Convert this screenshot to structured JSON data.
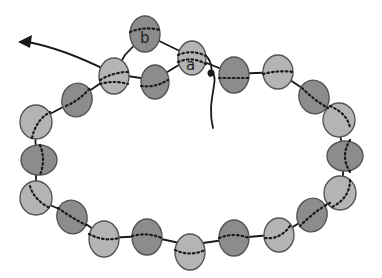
{
  "diagram": {
    "labels": {
      "a": "a",
      "b": "b"
    },
    "colors": {
      "light_bead": "#b4b4b4",
      "dark_bead": "#8c8c8c",
      "thread": "#1a1a1a"
    },
    "beads": [
      {
        "id": "b",
        "shade": "dark",
        "label": "b"
      },
      {
        "id": "a",
        "shade": "light",
        "label": "a"
      },
      {
        "id": "top-right-1",
        "shade": "dark"
      },
      {
        "id": "top-right-2",
        "shade": "light"
      },
      {
        "id": "right-1",
        "shade": "dark"
      },
      {
        "id": "right-2",
        "shade": "light"
      },
      {
        "id": "right-3",
        "shade": "dark"
      },
      {
        "id": "right-4",
        "shade": "light"
      },
      {
        "id": "bottom-right-1",
        "shade": "dark"
      },
      {
        "id": "bottom-right-2",
        "shade": "light"
      },
      {
        "id": "bottom-1",
        "shade": "dark"
      },
      {
        "id": "bottom-2",
        "shade": "light"
      },
      {
        "id": "bottom-3",
        "shade": "dark"
      },
      {
        "id": "bottom-4",
        "shade": "light"
      },
      {
        "id": "left-1",
        "shade": "dark"
      },
      {
        "id": "left-2",
        "shade": "light"
      },
      {
        "id": "left-3",
        "shade": "dark"
      },
      {
        "id": "left-4",
        "shade": "light"
      },
      {
        "id": "left-5",
        "shade": "dark"
      },
      {
        "id": "top-left-1",
        "shade": "light"
      },
      {
        "id": "top-center",
        "shade": "dark"
      }
    ]
  }
}
